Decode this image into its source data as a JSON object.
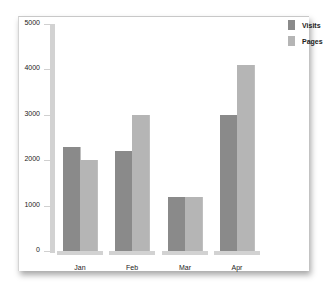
{
  "chart_data": {
    "type": "bar",
    "title": "",
    "xlabel": "",
    "ylabel": "",
    "categories": [
      "Jan",
      "Feb",
      "Mar",
      "Apr"
    ],
    "series": [
      {
        "name": "Visits",
        "values": [
          2300,
          2200,
          1200,
          3000
        ],
        "color": "#8a8a8a"
      },
      {
        "name": "Pages",
        "values": [
          2000,
          3000,
          1200,
          4100
        ],
        "color": "#b5b5b5"
      }
    ],
    "ylim": [
      0,
      5000
    ],
    "yticks": [
      0,
      1000,
      2000,
      3000,
      4000,
      5000
    ],
    "grid": false,
    "legend_position": "top-right"
  },
  "legend": {
    "items": [
      {
        "label": "Visits",
        "color": "#8a8a8a"
      },
      {
        "label": "Pages",
        "color": "#b5b5b5"
      }
    ]
  }
}
